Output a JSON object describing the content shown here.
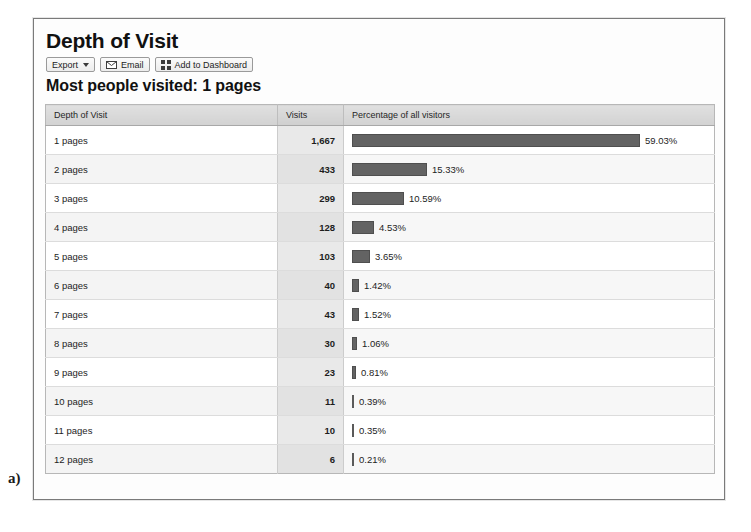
{
  "figure": {
    "label": "a)"
  },
  "report": {
    "title": "Depth of Visit",
    "subtitle": "Most people visited: 1 pages"
  },
  "toolbar": {
    "export_label": "Export",
    "email_label": "Email",
    "email_icon": "envelope-icon",
    "dashboard_label": "Add to Dashboard",
    "dashboard_icon": "grid-icon",
    "caret_icon": "chevron-down-icon"
  },
  "table": {
    "headers": {
      "depth": "Depth of Visit",
      "visits": "Visits",
      "percentage": "Percentage of all visitors"
    }
  },
  "colors": {
    "bar_fill": "#636363",
    "bar_border": "#4f4f4f",
    "header_bg": "#d8d8d8",
    "visits_col_bg": "#e9e9e9",
    "panel_border": "#7a7a7a"
  },
  "chart_data": {
    "type": "bar",
    "title": "Depth of Visit",
    "subtitle": "Most people visited: 1 pages",
    "orientation": "horizontal",
    "xlabel": "Percentage of all visitors",
    "ylabel": "Depth of Visit",
    "grid": false,
    "legend": null,
    "axis_max_percent": 59.03,
    "categories": [
      "1 pages",
      "2 pages",
      "3 pages",
      "4 pages",
      "5 pages",
      "6 pages",
      "7 pages",
      "8 pages",
      "9 pages",
      "10 pages",
      "11 pages",
      "12 pages"
    ],
    "series": [
      {
        "name": "Visits",
        "values": [
          1667,
          433,
          299,
          128,
          103,
          40,
          43,
          30,
          23,
          11,
          10,
          6
        ]
      },
      {
        "name": "Percentage of all visitors",
        "values": [
          59.03,
          15.33,
          10.59,
          4.53,
          3.65,
          1.42,
          1.52,
          1.06,
          0.81,
          0.39,
          0.35,
          0.21
        ]
      }
    ],
    "rows": [
      {
        "depth": "1 pages",
        "visits": "1,667",
        "percent_label": "59.03%",
        "percent": 59.03
      },
      {
        "depth": "2 pages",
        "visits": "433",
        "percent_label": "15.33%",
        "percent": 15.33
      },
      {
        "depth": "3 pages",
        "visits": "299",
        "percent_label": "10.59%",
        "percent": 10.59
      },
      {
        "depth": "4 pages",
        "visits": "128",
        "percent_label": "4.53%",
        "percent": 4.53
      },
      {
        "depth": "5 pages",
        "visits": "103",
        "percent_label": "3.65%",
        "percent": 3.65
      },
      {
        "depth": "6 pages",
        "visits": "40",
        "percent_label": "1.42%",
        "percent": 1.42
      },
      {
        "depth": "7 pages",
        "visits": "43",
        "percent_label": "1.52%",
        "percent": 1.52
      },
      {
        "depth": "8 pages",
        "visits": "30",
        "percent_label": "1.06%",
        "percent": 1.06
      },
      {
        "depth": "9 pages",
        "visits": "23",
        "percent_label": "0.81%",
        "percent": 0.81
      },
      {
        "depth": "10 pages",
        "visits": "11",
        "percent_label": "0.39%",
        "percent": 0.39
      },
      {
        "depth": "11 pages",
        "visits": "10",
        "percent_label": "0.35%",
        "percent": 0.35
      },
      {
        "depth": "12 pages",
        "visits": "6",
        "percent_label": "0.21%",
        "percent": 0.21
      }
    ]
  }
}
